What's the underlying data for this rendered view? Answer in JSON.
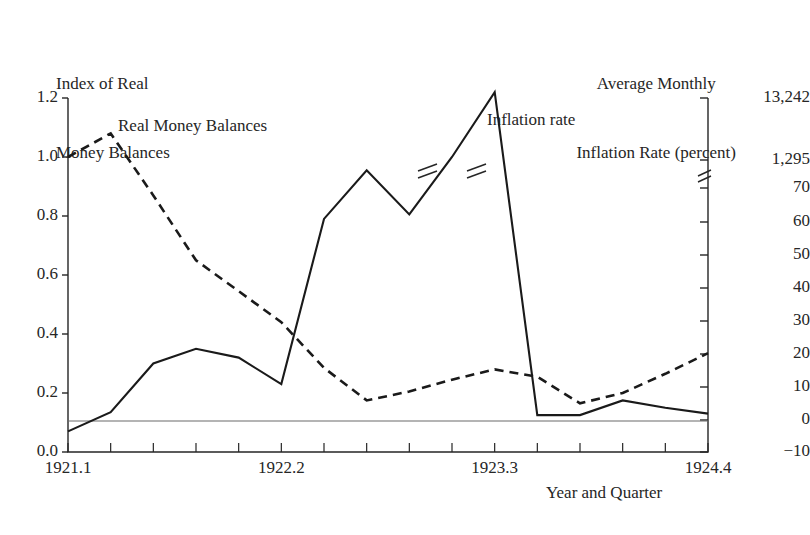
{
  "headers": {
    "left_axis_title": "Index of Real\nMoney Balances",
    "left_axis_title_line1": "Index of Real",
    "left_axis_title_line2": "Money Balances",
    "right_axis_title_line1": "Average Monthly",
    "right_axis_title_line2": "Inflation Rate (percent)"
  },
  "axes": {
    "x_title": "Year and Quarter",
    "left_ticks": [
      "1.2",
      "1.0",
      "0.8",
      "0.6",
      "0.4",
      "0.2",
      "0.0"
    ],
    "right_ticks": [
      "13,242",
      "1,295",
      "70",
      "60",
      "50",
      "40",
      "30",
      "20",
      "10",
      "0",
      "-10"
    ],
    "x_tick_labels": [
      "1921.1",
      "1922.2",
      "1923.3",
      "1924.4"
    ]
  },
  "series_labels": {
    "real_money_balances": "Real Money Balances",
    "inflation_rate": "Inflation rate"
  },
  "colors": {
    "ink": "#262626",
    "line": "#1a1a1a",
    "reference_line": "#6a6a6a",
    "background": "#ffffff"
  },
  "chart_data": {
    "type": "line",
    "title": "",
    "xlabel": "Year and Quarter",
    "ylabel": "Index of Real Money Balances",
    "y2label": "Average Monthly Inflation Rate (percent)",
    "grid": false,
    "legend": "inline-annotations",
    "x": [
      "1921.1",
      "1921.2",
      "1921.3",
      "1921.4",
      "1922.1",
      "1922.2",
      "1922.3",
      "1922.4",
      "1923.1",
      "1923.2",
      "1923.3",
      "1923.4",
      "1924.1",
      "1924.2",
      "1924.3",
      "1924.4"
    ],
    "ylim": [
      0.0,
      1.2
    ],
    "y2_tick_values": [
      13242,
      1295,
      70,
      60,
      50,
      40,
      30,
      20,
      10,
      0,
      -10
    ],
    "y2_axis_break_between": [
      1295,
      70
    ],
    "series": [
      {
        "name": "Real Money Balances",
        "axis": "left",
        "style": "dashed",
        "values": [
          1.0,
          1.08,
          0.87,
          0.65,
          0.545,
          0.44,
          0.285,
          0.175,
          0.205,
          0.245,
          0.28,
          0.255,
          0.165,
          0.2,
          0.265,
          0.335
        ]
      },
      {
        "name": "Inflation rate",
        "axis": "right",
        "style": "solid",
        "plot_positions_left_scale": [
          0.07,
          0.135,
          0.3,
          0.35,
          0.32,
          0.23,
          0.79,
          0.955,
          0.805,
          1.0,
          1.22,
          0.125,
          0.125,
          0.175,
          0.15,
          0.13
        ],
        "values_percent": [
          -3,
          3,
          18,
          22,
          20,
          12,
          62,
          70,
          64,
          1295,
          13242,
          1,
          1,
          6,
          4,
          2
        ],
        "line_break_markers_at_x": [
          "1923.2",
          "1923.3"
        ]
      }
    ],
    "reference_line": {
      "axis": "right",
      "value": 0,
      "note": "horizontal zero-inflation line"
    }
  }
}
